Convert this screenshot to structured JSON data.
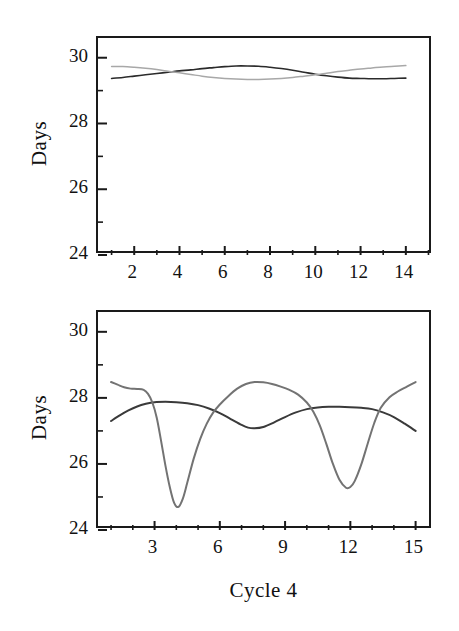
{
  "figure": {
    "background_color": "#ffffff",
    "xlabel": "Cycle 4"
  },
  "chart_data": [
    {
      "type": "line",
      "panel": "top",
      "title": "",
      "xlabel": "",
      "ylabel": "Days",
      "xlim": [
        0.4,
        15.2
      ],
      "ylim": [
        24,
        30.6
      ],
      "xticks_major": [
        2,
        4,
        6,
        8,
        10,
        12,
        14
      ],
      "xticks_minor": [
        1,
        3,
        5,
        7,
        9,
        11,
        13,
        15
      ],
      "xtick_labels": [
        "2",
        "4",
        "6",
        "8",
        "10",
        "12",
        "14"
      ],
      "yticks_major": [
        24,
        26,
        28,
        30
      ],
      "yticks_minor": [
        25,
        27,
        29
      ],
      "ytick_labels": [
        "24",
        "26",
        "28",
        "30"
      ],
      "grid": false,
      "legend": "none",
      "series": [
        {
          "name": "dark-curve-top",
          "color": "#2b2b2b",
          "width": 1.6,
          "x": [
            1.0,
            1.5,
            2.0,
            2.5,
            3.0,
            3.5,
            4.0,
            4.5,
            5.0,
            5.5,
            6.0,
            6.5,
            7.0,
            7.5,
            8.0,
            8.5,
            9.0,
            9.5,
            10.0,
            10.5,
            11.0,
            11.5,
            12.0,
            12.5,
            13.0,
            13.5,
            14.0
          ],
          "y": [
            29.37,
            29.4,
            29.44,
            29.48,
            29.52,
            29.56,
            29.6,
            29.63,
            29.67,
            29.7,
            29.73,
            29.75,
            29.75,
            29.74,
            29.71,
            29.67,
            29.62,
            29.56,
            29.5,
            29.45,
            29.41,
            29.38,
            29.37,
            29.36,
            29.36,
            29.37,
            29.38
          ]
        },
        {
          "name": "light-curve-top",
          "color": "#a8a8a8",
          "width": 1.5,
          "x": [
            1.0,
            1.5,
            2.0,
            2.5,
            3.0,
            3.5,
            4.0,
            4.5,
            5.0,
            5.5,
            6.0,
            6.5,
            7.0,
            7.5,
            8.0,
            8.5,
            9.0,
            9.5,
            10.0,
            10.5,
            11.0,
            11.5,
            12.0,
            12.5,
            13.0,
            13.5,
            14.0
          ],
          "y": [
            29.73,
            29.73,
            29.71,
            29.68,
            29.64,
            29.59,
            29.54,
            29.49,
            29.44,
            29.4,
            29.37,
            29.35,
            29.34,
            29.34,
            29.35,
            29.37,
            29.4,
            29.44,
            29.48,
            29.53,
            29.58,
            29.62,
            29.66,
            29.69,
            29.72,
            29.74,
            29.76
          ]
        }
      ]
    },
    {
      "type": "line",
      "panel": "bottom",
      "title": "",
      "xlabel": "Cycle 4",
      "ylabel": "Days",
      "xlim": [
        0.4,
        15.8
      ],
      "ylim": [
        24,
        30.6
      ],
      "xticks_major": [
        3,
        6,
        9,
        12,
        15
      ],
      "xticks_minor": [
        1,
        2,
        4,
        5,
        7,
        8,
        10,
        11,
        13,
        14
      ],
      "xtick_labels": [
        "3",
        "6",
        "9",
        "12",
        "15"
      ],
      "yticks_major": [
        24,
        26,
        28,
        30
      ],
      "yticks_minor": [
        25,
        27,
        29
      ],
      "ytick_labels": [
        "24",
        "26",
        "28",
        "30"
      ],
      "grid": false,
      "legend": "none",
      "series": [
        {
          "name": "dark-curve-bottom",
          "color": "#3a3a3a",
          "width": 2.0,
          "x": [
            1.0,
            1.4,
            1.8,
            2.2,
            2.6,
            3.0,
            3.5,
            4.0,
            4.5,
            5.0,
            5.5,
            6.0,
            6.5,
            7.0,
            7.3,
            7.6,
            8.0,
            8.5,
            9.0,
            9.5,
            10.0,
            10.5,
            11.0,
            11.5,
            12.0,
            12.5,
            13.0,
            13.5,
            14.0,
            14.5,
            15.0
          ],
          "y": [
            27.3,
            27.47,
            27.62,
            27.74,
            27.82,
            27.87,
            27.88,
            27.87,
            27.84,
            27.78,
            27.68,
            27.54,
            27.36,
            27.18,
            27.1,
            27.08,
            27.12,
            27.26,
            27.42,
            27.56,
            27.66,
            27.71,
            27.73,
            27.73,
            27.72,
            27.7,
            27.66,
            27.56,
            27.42,
            27.22,
            27.0
          ]
        },
        {
          "name": "gray-curve-bottom",
          "color": "#737373",
          "width": 2.0,
          "x": [
            1.0,
            1.3,
            1.6,
            1.9,
            2.2,
            2.5,
            2.7,
            2.9,
            3.1,
            3.3,
            3.5,
            3.7,
            3.9,
            4.1,
            4.3,
            4.5,
            4.8,
            5.1,
            5.4,
            5.7,
            6.0,
            6.4,
            6.8,
            7.2,
            7.6,
            8.0,
            8.4,
            8.8,
            9.2,
            9.6,
            10.0,
            10.3,
            10.6,
            10.9,
            11.2,
            11.5,
            11.8,
            12.0,
            12.2,
            12.5,
            12.8,
            13.1,
            13.4,
            13.8,
            14.2,
            14.6,
            15.0
          ],
          "y": [
            28.48,
            28.4,
            28.32,
            28.28,
            28.27,
            28.24,
            28.12,
            27.86,
            27.4,
            26.7,
            25.95,
            25.3,
            24.82,
            24.7,
            24.95,
            25.42,
            26.16,
            26.76,
            27.22,
            27.56,
            27.8,
            28.06,
            28.28,
            28.42,
            28.48,
            28.47,
            28.42,
            28.34,
            28.24,
            28.1,
            27.86,
            27.58,
            27.16,
            26.6,
            26.0,
            25.52,
            25.28,
            25.3,
            25.48,
            25.98,
            26.62,
            27.24,
            27.7,
            28.02,
            28.2,
            28.34,
            28.48
          ]
        }
      ]
    }
  ]
}
